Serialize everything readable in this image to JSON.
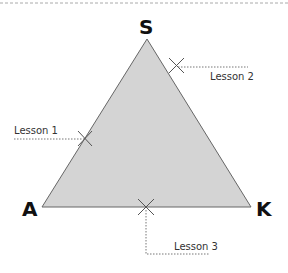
{
  "diagram": {
    "type": "triangle",
    "fill": "#d4d4d4",
    "stroke": "#666666",
    "vertices": [
      {
        "id": "S",
        "label": "S",
        "x": 147,
        "y": 39
      },
      {
        "id": "A",
        "label": "A",
        "x": 42,
        "y": 207
      },
      {
        "id": "K",
        "label": "K",
        "x": 251,
        "y": 207
      }
    ],
    "lessons": [
      {
        "label": "Lesson 1",
        "on_edge": "S-A"
      },
      {
        "label": "Lesson 2",
        "on_edge": "S-K"
      },
      {
        "label": "Lesson 3",
        "on_edge": "A-K"
      }
    ]
  }
}
